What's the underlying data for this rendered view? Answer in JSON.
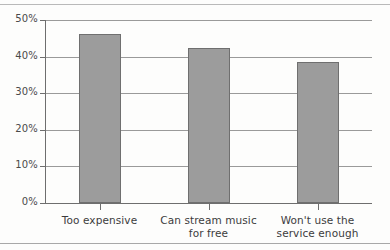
{
  "chart_data": {
    "type": "bar",
    "title": "",
    "subtitle": "",
    "xlabel": "",
    "ylabel": "",
    "categories": [
      "Too expensive",
      "Can stream music for free",
      "Won't use the service enough"
    ],
    "category_lines": [
      [
        "Too expensive"
      ],
      [
        "Can stream music",
        "for free"
      ],
      [
        "Won't use the",
        "service enough"
      ]
    ],
    "values": [
      46.2,
      42.3,
      38.5
    ],
    "ylim": [
      0,
      50
    ],
    "ytick_values": [
      0,
      10,
      20,
      30,
      40,
      50
    ],
    "ytick_labels": [
      "0%",
      "10%",
      "20%",
      "30%",
      "40%",
      "50%"
    ],
    "grid": true,
    "legend": false,
    "legend_position": "none",
    "bar_color": "#9c9c9c",
    "bar_border_color": "#6f6f6f",
    "axis_color": "#6e6e6e",
    "gridline_color": "#9a9a9a",
    "background_color": "#fdfdfc"
  }
}
